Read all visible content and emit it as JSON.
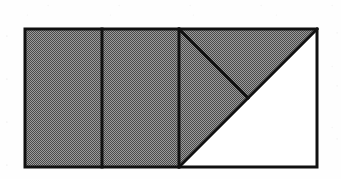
{
  "figure": {
    "description": "A rectangle divided into three equal vertical columns; the third column is split by diagonals, leaving a white triangular region at the lower right while the rest is shaded gray.",
    "canvas": {
      "width": 341,
      "height": 179
    },
    "colors": {
      "background": "#fefefe",
      "shaded_fill": "#808080",
      "unshaded_fill": "#ffffff",
      "stroke": "#111111"
    },
    "stroke_width": 3,
    "rectangle": {
      "label": "outer-rectangle",
      "x": 25,
      "y": 29,
      "width": 292,
      "height": 138,
      "right": 317,
      "bottom": 167
    },
    "dividers": [
      {
        "label": "divider-1",
        "x": 102,
        "y1": 29,
        "y2": 167
      },
      {
        "label": "divider-2",
        "x": 179,
        "y1": 29,
        "y2": 167
      }
    ],
    "diagonals": [
      {
        "label": "major-diagonal",
        "from": [
          179,
          167
        ],
        "to": [
          317,
          29
        ],
        "angle_deg": 45
      },
      {
        "label": "minor-diagonal",
        "from": [
          179,
          29
        ],
        "to": [
          248,
          98
        ],
        "angle_deg": -45
      }
    ],
    "regions": [
      {
        "label": "column-1",
        "shaded": true,
        "fill": "#808080",
        "points": "25,29 102,29 102,167 25,167"
      },
      {
        "label": "column-2",
        "shaded": true,
        "fill": "#808080",
        "points": "102,29 179,29 179,167 102,167"
      },
      {
        "label": "column-3-upper-left-triangle",
        "shaded": true,
        "fill": "#808080",
        "points": "179,29 248,98 179,98"
      },
      {
        "label": "column-3-shaded-wedge",
        "shaded": true,
        "fill": "#808080",
        "points": "179,29 317,29 179,167"
      },
      {
        "label": "column-3-white-triangle",
        "shaded": false,
        "fill": "#ffffff",
        "points": "179,167 317,29 317,167"
      }
    ]
  }
}
